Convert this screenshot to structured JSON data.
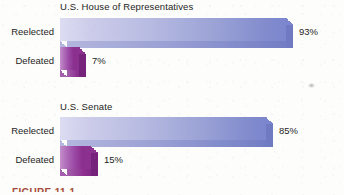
{
  "figure": {
    "caption": "FIGURE 11-1",
    "artifact_name": "scan-speck"
  },
  "charts": [
    {
      "id": "house",
      "title": "U.S. House of Representatives",
      "rows": [
        {
          "label": "Reelected",
          "value": 93,
          "value_label": "93%",
          "color_key": "blue"
        },
        {
          "label": "Defeated",
          "value": 7,
          "value_label": "7%",
          "color_key": "purple"
        }
      ]
    },
    {
      "id": "senate",
      "title": "U.S. Senate",
      "rows": [
        {
          "label": "Reelected",
          "value": 85,
          "value_label": "85%",
          "color_key": "blue"
        },
        {
          "label": "Defeated",
          "value": 15,
          "value_label": "15%",
          "color_key": "purple"
        }
      ]
    }
  ],
  "colors": {
    "blue_light": "#dcdcf2",
    "blue_dark": "#7b86ce",
    "blue_shadow": "#6f7ac2",
    "purple_light": "#c48ec9",
    "purple_dark": "#8b2f8e",
    "purple_shadow": "#75237a",
    "text": "#1d1d1d",
    "caption": "#9c3a26",
    "background": "#fdfdfb"
  },
  "chart_data": {
    "type": "bar",
    "orientation": "horizontal",
    "xlabel": "",
    "ylabel": "",
    "xlim": [
      0,
      100
    ],
    "grid": false,
    "legend": false,
    "units": "percent",
    "panels": [
      {
        "title": "U.S. House of Representatives",
        "categories": [
          "Reelected",
          "Defeated"
        ],
        "values": [
          93,
          7
        ],
        "data_labels": [
          "93%",
          "7%"
        ]
      },
      {
        "title": "U.S. Senate",
        "categories": [
          "Reelected",
          "Defeated"
        ],
        "values": [
          85,
          15
        ],
        "data_labels": [
          "85%",
          "15%"
        ]
      }
    ]
  }
}
